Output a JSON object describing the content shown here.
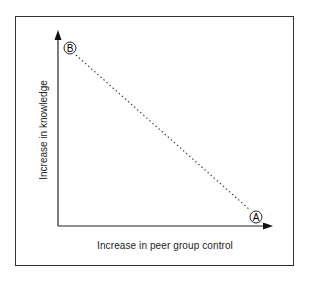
{
  "diagram": {
    "x_axis_label": "Increase in peer group control",
    "y_axis_label": "Increase in knowledge",
    "points": [
      {
        "id": "B",
        "label": "B",
        "position": "top-left"
      },
      {
        "id": "A",
        "label": "A",
        "position": "bottom-right"
      }
    ],
    "connector": {
      "style": "dotted",
      "from": "B",
      "to": "A"
    },
    "colors": {
      "line": "#222222",
      "frame": "#333333",
      "background": "#ffffff"
    }
  }
}
